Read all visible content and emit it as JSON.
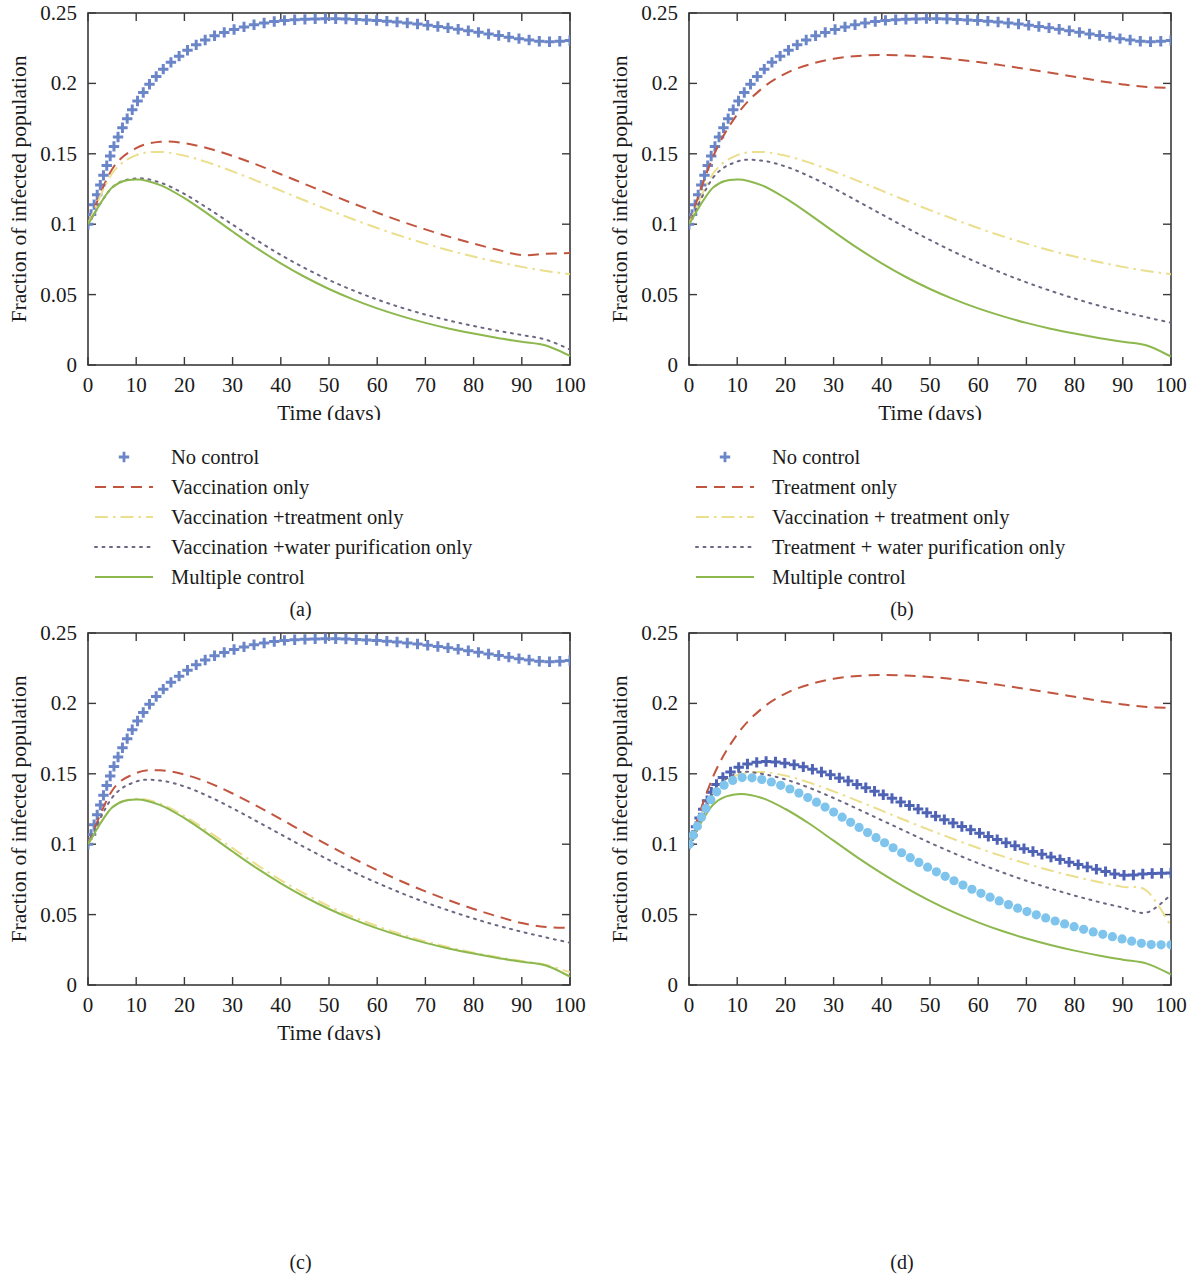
{
  "figure": {
    "panels": [
      {
        "caption": "(a)",
        "xlabel": "Time (days)",
        "ylabel": "Fraction of infected population",
        "show_xlabel": true,
        "legend": [
          {
            "label": "No control",
            "style": "plus",
            "color": "#6B86C8"
          },
          {
            "label": "Vaccination only",
            "style": "dashed",
            "color": "#C1553F"
          },
          {
            "label": "Vaccination +treatment only",
            "style": "dashdot",
            "color": "#EBDE8C"
          },
          {
            "label": "Vaccination +water purification only",
            "style": "dotted",
            "color": "#6E6784"
          },
          {
            "label": "Multiple control",
            "style": "solid",
            "color": "#8CB84E"
          }
        ]
      },
      {
        "caption": "(b)",
        "xlabel": "Time (days)",
        "ylabel": "Fraction of infected population",
        "show_xlabel": true,
        "legend": [
          {
            "label": "No control",
            "style": "plus",
            "color": "#6B86C8"
          },
          {
            "label": "Treatment only",
            "style": "dashed",
            "color": "#C1553F"
          },
          {
            "label": "Vaccination + treatment only",
            "style": "dashdot",
            "color": "#EBDE8C"
          },
          {
            "label": "Treatment + water purification only",
            "style": "dotted",
            "color": "#6E6784"
          },
          {
            "label": "Multiple control",
            "style": "solid",
            "color": "#8CB84E"
          }
        ]
      },
      {
        "caption": "(c)",
        "xlabel": "Time (days)",
        "ylabel": "Fraction of infected population",
        "show_xlabel": true,
        "legend": [
          {
            "label": "No control",
            "style": "plus",
            "color": "#6B86C8"
          },
          {
            "label": "Water purification only",
            "style": "dashed",
            "color": "#C1553F"
          },
          {
            "label": "Vaccination + water purification only",
            "style": "dashdot",
            "color": "#EBDE8C"
          },
          {
            "label": "Treatment + water purification only",
            "style": "dotted",
            "color": "#6E6784"
          },
          {
            "label": "Multiple control",
            "style": "solid",
            "color": "#8CB84E"
          }
        ]
      },
      {
        "caption": "(d)",
        "xlabel": "Time (days)",
        "ylabel": "Fraction of infected population",
        "show_xlabel": false,
        "legend": [
          {
            "label": "vaccination only",
            "style": "plus",
            "color": "#4F63B5"
          },
          {
            "label": "Treatment only",
            "style": "dashed",
            "color": "#C1553F"
          },
          {
            "label": "Water purification only",
            "style": "dashdot",
            "color": "#EBDE8C"
          },
          {
            "label": "Vaccination + Treatment only",
            "style": "dotted",
            "color": "#6E6784"
          },
          {
            "label": "Vaccination + water purification only",
            "style": "solid",
            "color": "#8CB84E"
          },
          {
            "label": "Treatment + water purification only",
            "style": "circles",
            "color": "#7FC4EC"
          }
        ]
      }
    ]
  },
  "chart_data": [
    {
      "type": "line",
      "title": "(a)",
      "xlabel": "Time (days)",
      "ylabel": "Fraction of infected population",
      "xlim": [
        0,
        100
      ],
      "ylim": [
        0,
        0.25
      ],
      "xticks": [
        0,
        10,
        20,
        30,
        40,
        50,
        60,
        70,
        80,
        90,
        100
      ],
      "yticks": [
        0,
        0.05,
        0.1,
        0.15,
        0.2,
        0.25
      ],
      "ytick_labels": [
        "0",
        "0.05",
        "0.1",
        "0.15",
        "0.2",
        "0.25"
      ],
      "grid": false,
      "legend_position": "below",
      "x": [
        0,
        5,
        10,
        15,
        20,
        25,
        30,
        35,
        40,
        45,
        50,
        55,
        60,
        65,
        70,
        75,
        80,
        85,
        90,
        95,
        100
      ],
      "series": [
        {
          "name": "No control",
          "style": "plus",
          "color": "#6B86C8",
          "values": [
            0.1,
            0.152,
            0.186,
            0.208,
            0.222,
            0.232,
            0.238,
            0.242,
            0.2445,
            0.2455,
            0.246,
            0.2455,
            0.2447,
            0.2433,
            0.2415,
            0.2393,
            0.2368,
            0.2341,
            0.2315,
            0.2296,
            0.2305
          ]
        },
        {
          "name": "Vaccination only",
          "style": "dashed",
          "color": "#C1553F",
          "values": [
            0.1,
            0.139,
            0.154,
            0.1585,
            0.1575,
            0.1538,
            0.1485,
            0.1423,
            0.1355,
            0.1285,
            0.1215,
            0.1147,
            0.1082,
            0.102,
            0.0963,
            0.091,
            0.0862,
            0.0818,
            0.078,
            0.079,
            0.0795
          ]
        },
        {
          "name": "Vaccination +treatment only",
          "style": "dashdot",
          "color": "#EBDE8C",
          "values": [
            0.1,
            0.136,
            0.149,
            0.1513,
            0.1487,
            0.1437,
            0.1375,
            0.1308,
            0.1238,
            0.1168,
            0.11,
            0.1035,
            0.0973,
            0.0915,
            0.0862,
            0.0813,
            0.077,
            0.0731,
            0.0697,
            0.0668,
            0.0645
          ]
        },
        {
          "name": "Vaccination +water purification only",
          "style": "dotted",
          "color": "#6E6784",
          "values": [
            0.1,
            0.126,
            0.1325,
            0.1295,
            0.1215,
            0.111,
            0.0997,
            0.0886,
            0.0782,
            0.0688,
            0.0604,
            0.053,
            0.0465,
            0.0408,
            0.0358,
            0.0315,
            0.0277,
            0.0243,
            0.0213,
            0.018,
            0.011
          ]
        },
        {
          "name": "Multiple control",
          "style": "solid",
          "color": "#8CB84E",
          "values": [
            0.1,
            0.126,
            0.1318,
            0.1278,
            0.1185,
            0.107,
            0.0948,
            0.083,
            0.0722,
            0.0625,
            0.054,
            0.0466,
            0.0402,
            0.0347,
            0.0299,
            0.0258,
            0.0223,
            0.0192,
            0.0165,
            0.0138,
            0.0065
          ]
        }
      ]
    },
    {
      "type": "line",
      "title": "(b)",
      "xlabel": "Time (days)",
      "ylabel": "Fraction of infected population",
      "xlim": [
        0,
        100
      ],
      "ylim": [
        0,
        0.25
      ],
      "xticks": [
        0,
        10,
        20,
        30,
        40,
        50,
        60,
        70,
        80,
        90,
        100
      ],
      "yticks": [
        0,
        0.05,
        0.1,
        0.15,
        0.2,
        0.25
      ],
      "ytick_labels": [
        "0",
        "0.05",
        "0.1",
        "0.15",
        "0.2",
        "0.25"
      ],
      "grid": false,
      "legend_position": "below",
      "x": [
        0,
        5,
        10,
        15,
        20,
        25,
        30,
        35,
        40,
        45,
        50,
        55,
        60,
        65,
        70,
        75,
        80,
        85,
        90,
        95,
        100
      ],
      "series": [
        {
          "name": "No control",
          "style": "plus",
          "color": "#6B86C8",
          "values": [
            0.1,
            0.152,
            0.186,
            0.208,
            0.222,
            0.232,
            0.238,
            0.242,
            0.2445,
            0.2455,
            0.246,
            0.2455,
            0.2447,
            0.2433,
            0.2415,
            0.2393,
            0.2368,
            0.2341,
            0.2315,
            0.2296,
            0.2305
          ]
        },
        {
          "name": "Treatment only",
          "style": "dashed",
          "color": "#C1553F",
          "values": [
            0.1,
            0.148,
            0.178,
            0.196,
            0.207,
            0.2135,
            0.2175,
            0.2195,
            0.2202,
            0.2198,
            0.2188,
            0.2172,
            0.2152,
            0.2128,
            0.2102,
            0.2075,
            0.2047,
            0.2018,
            0.1993,
            0.1975,
            0.1968
          ]
        },
        {
          "name": "Vaccination + treatment only",
          "style": "dashdot",
          "color": "#EBDE8C",
          "values": [
            0.1,
            0.136,
            0.149,
            0.1513,
            0.1487,
            0.1437,
            0.1375,
            0.1308,
            0.1238,
            0.1168,
            0.11,
            0.1035,
            0.0973,
            0.0915,
            0.0862,
            0.0813,
            0.077,
            0.0731,
            0.0697,
            0.0668,
            0.0645
          ]
        },
        {
          "name": "Treatment + water purification only",
          "style": "dotted",
          "color": "#6E6784",
          "values": [
            0.1,
            0.133,
            0.1445,
            0.1452,
            0.141,
            0.134,
            0.1255,
            0.1163,
            0.107,
            0.0977,
            0.0888,
            0.0803,
            0.0725,
            0.0653,
            0.0587,
            0.0527,
            0.0472,
            0.0422,
            0.0378,
            0.0338,
            0.03
          ]
        },
        {
          "name": "Multiple control",
          "style": "solid",
          "color": "#8CB84E",
          "values": [
            0.1,
            0.126,
            0.1318,
            0.1278,
            0.1185,
            0.107,
            0.0948,
            0.083,
            0.0722,
            0.0625,
            0.054,
            0.0466,
            0.0402,
            0.0347,
            0.0299,
            0.0258,
            0.0223,
            0.0192,
            0.0165,
            0.0138,
            0.006
          ]
        }
      ]
    },
    {
      "type": "line",
      "title": "(c)",
      "xlabel": "Time (days)",
      "ylabel": "Fraction of infected population",
      "xlim": [
        0,
        100
      ],
      "ylim": [
        0,
        0.25
      ],
      "xticks": [
        0,
        10,
        20,
        30,
        40,
        50,
        60,
        70,
        80,
        90,
        100
      ],
      "yticks": [
        0,
        0.05,
        0.1,
        0.15,
        0.2,
        0.25
      ],
      "ytick_labels": [
        "0",
        "0.05",
        "0.1",
        "0.15",
        "0.2",
        "0.25"
      ],
      "grid": false,
      "legend_position": "below",
      "x": [
        0,
        5,
        10,
        15,
        20,
        25,
        30,
        35,
        40,
        45,
        50,
        55,
        60,
        65,
        70,
        75,
        80,
        85,
        90,
        95,
        100
      ],
      "series": [
        {
          "name": "No control",
          "style": "plus",
          "color": "#6B86C8",
          "values": [
            0.1,
            0.152,
            0.186,
            0.208,
            0.222,
            0.232,
            0.238,
            0.242,
            0.2445,
            0.2455,
            0.246,
            0.2455,
            0.2447,
            0.2433,
            0.2415,
            0.2393,
            0.2368,
            0.2341,
            0.2315,
            0.2296,
            0.2305
          ]
        },
        {
          "name": "Water purification only",
          "style": "dashed",
          "color": "#C1553F",
          "values": [
            0.1,
            0.138,
            0.1505,
            0.1525,
            0.1495,
            0.1437,
            0.136,
            0.1272,
            0.1178,
            0.1083,
            0.099,
            0.09,
            0.0815,
            0.0737,
            0.0665,
            0.06,
            0.054,
            0.0487,
            0.044,
            0.0412,
            0.0405
          ]
        },
        {
          "name": "Vaccination + water purification only",
          "style": "dashdot",
          "color": "#EBDE8C",
          "values": [
            0.1,
            0.126,
            0.1322,
            0.1288,
            0.12,
            0.109,
            0.0972,
            0.0855,
            0.0745,
            0.0648,
            0.056,
            0.0484,
            0.0418,
            0.036,
            0.031,
            0.0267,
            0.023,
            0.0198,
            0.017,
            0.0143,
            0.009
          ]
        },
        {
          "name": "Treatment + water purification only",
          "style": "dotted",
          "color": "#6E6784",
          "values": [
            0.1,
            0.133,
            0.1445,
            0.1452,
            0.141,
            0.134,
            0.1255,
            0.1163,
            0.107,
            0.0977,
            0.0888,
            0.0803,
            0.0725,
            0.0653,
            0.0587,
            0.0527,
            0.0472,
            0.0422,
            0.0378,
            0.0338,
            0.03
          ]
        },
        {
          "name": "Multiple control",
          "style": "solid",
          "color": "#8CB84E",
          "values": [
            0.1,
            0.126,
            0.1318,
            0.1278,
            0.1185,
            0.107,
            0.0948,
            0.083,
            0.0722,
            0.0625,
            0.054,
            0.0466,
            0.0402,
            0.0347,
            0.0299,
            0.0258,
            0.0223,
            0.0192,
            0.0165,
            0.0138,
            0.006
          ]
        }
      ]
    },
    {
      "type": "line",
      "title": "(d)",
      "xlabel": "Time (days)",
      "ylabel": "Fraction of infected population",
      "xlim": [
        0,
        100
      ],
      "ylim": [
        0,
        0.25
      ],
      "xticks": [
        0,
        10,
        20,
        30,
        40,
        50,
        60,
        70,
        80,
        90,
        100
      ],
      "yticks": [
        0,
        0.05,
        0.1,
        0.15,
        0.2,
        0.25
      ],
      "ytick_labels": [
        "0",
        "0.05",
        "0.1",
        "0.15",
        "0.2",
        "0.25"
      ],
      "grid": false,
      "legend_position": "below",
      "x": [
        0,
        5,
        10,
        15,
        20,
        25,
        30,
        35,
        40,
        45,
        50,
        55,
        60,
        65,
        70,
        75,
        80,
        85,
        90,
        95,
        100
      ],
      "series": [
        {
          "name": "vaccination only",
          "style": "plus",
          "color": "#4F63B5",
          "values": [
            0.1,
            0.139,
            0.154,
            0.1585,
            0.1575,
            0.1538,
            0.1485,
            0.1423,
            0.1355,
            0.1285,
            0.1215,
            0.1147,
            0.1082,
            0.102,
            0.0963,
            0.091,
            0.0862,
            0.0818,
            0.078,
            0.079,
            0.0795
          ]
        },
        {
          "name": "Treatment only",
          "style": "dashed",
          "color": "#C1553F",
          "values": [
            0.1,
            0.148,
            0.178,
            0.196,
            0.207,
            0.2135,
            0.2175,
            0.2195,
            0.2202,
            0.2198,
            0.2188,
            0.2172,
            0.2152,
            0.2128,
            0.2102,
            0.2075,
            0.2047,
            0.2018,
            0.1993,
            0.1975,
            0.1968
          ]
        },
        {
          "name": "Water purification only",
          "style": "dashdot",
          "color": "#EBDE8C",
          "values": [
            0.1,
            0.136,
            0.149,
            0.1513,
            0.1487,
            0.1437,
            0.1375,
            0.1308,
            0.1238,
            0.1168,
            0.11,
            0.1035,
            0.0973,
            0.0915,
            0.0862,
            0.0813,
            0.077,
            0.0731,
            0.0697,
            0.0668,
            0.042
          ]
        },
        {
          "name": "Vaccination + Treatment only",
          "style": "dotted",
          "color": "#6E6784",
          "values": [
            0.1,
            0.1365,
            0.1505,
            0.15,
            0.146,
            0.14,
            0.1328,
            0.125,
            0.117,
            0.109,
            0.101,
            0.0935,
            0.0865,
            0.08,
            0.074,
            0.0685,
            0.0635,
            0.059,
            0.055,
            0.0515,
            0.064
          ]
        },
        {
          "name": "Vaccination + water purification only",
          "style": "solid",
          "color": "#8CB84E",
          "values": [
            0.1,
            0.128,
            0.1355,
            0.133,
            0.125,
            0.1145,
            0.1025,
            0.0905,
            0.0793,
            0.069,
            0.0598,
            0.0516,
            0.0445,
            0.0383,
            0.033,
            0.0284,
            0.0244,
            0.021,
            0.018,
            0.0152,
            0.0075
          ]
        },
        {
          "name": "Treatment + water purification only",
          "style": "circles",
          "color": "#7FC4EC",
          "values": [
            0.1,
            0.134,
            0.1465,
            0.146,
            0.1405,
            0.1325,
            0.1228,
            0.1125,
            0.1022,
            0.0922,
            0.0828,
            0.074,
            0.066,
            0.0588,
            0.0523,
            0.0465,
            0.0413,
            0.0367,
            0.0326,
            0.029,
            0.0285
          ]
        }
      ]
    }
  ]
}
